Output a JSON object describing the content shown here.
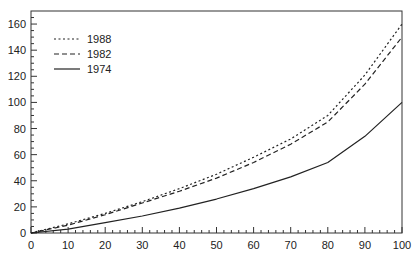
{
  "chart_data": {
    "type": "line",
    "title": "",
    "xlabel": "",
    "ylabel": "",
    "xlim": [
      0,
      100
    ],
    "ylim": [
      0,
      170
    ],
    "x_ticks": [
      0,
      10,
      20,
      30,
      40,
      50,
      60,
      70,
      80,
      90,
      100
    ],
    "y_ticks": [
      0,
      20,
      40,
      60,
      80,
      100,
      120,
      140,
      160
    ],
    "x_minor_step": 2,
    "y_minor_step": 5,
    "grid": false,
    "legend_position": "upper-left",
    "x": [
      0,
      10,
      20,
      30,
      40,
      50,
      60,
      70,
      80,
      90,
      100
    ],
    "series": [
      {
        "name": "1988",
        "style": "dotted",
        "values": [
          0,
          7,
          15,
          24,
          34,
          45,
          58,
          72,
          90,
          121,
          160
        ]
      },
      {
        "name": "1982",
        "style": "dashed",
        "values": [
          0,
          6,
          14,
          23,
          32,
          42,
          54,
          68,
          85,
          114,
          150
        ]
      },
      {
        "name": "1974",
        "style": "solid",
        "values": [
          0,
          3,
          8,
          13,
          19,
          26,
          34,
          43,
          54,
          74,
          100
        ]
      }
    ],
    "colors": {
      "line": "#222222",
      "axis": "#333333",
      "background": "#ffffff"
    }
  }
}
